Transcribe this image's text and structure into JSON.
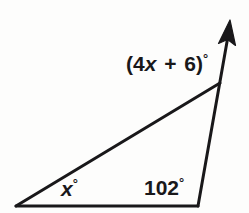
{
  "figure": {
    "background_color": "#fdfdfc",
    "stroke_color": "#19181a",
    "text_color": "#19181a",
    "labels": {
      "exterior_angle": {
        "open_paren": "(",
        "coefficient": "4",
        "variable": "x",
        "operator": "+",
        "constant": "6",
        "close_paren": ")",
        "degree": "°",
        "full_text": "(4x + 6)°"
      },
      "left_angle": {
        "variable": "x",
        "degree": "°",
        "full_text": "x°"
      },
      "interior_angle": {
        "value": "102",
        "degree": "°",
        "full_text": "102°"
      }
    },
    "geometry": {
      "vertex_left": [
        16,
        206
      ],
      "vertex_bottom_right": [
        198,
        206
      ],
      "vertex_top": [
        220,
        83
      ],
      "arrow_tip": [
        230,
        21
      ],
      "stroke_width": 3
    }
  }
}
